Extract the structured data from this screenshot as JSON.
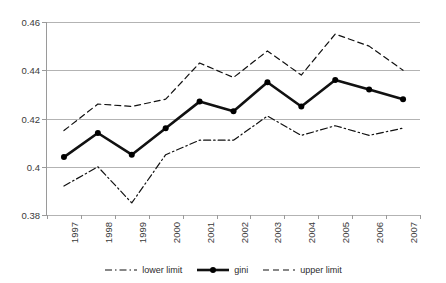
{
  "title_band": {
    "clipped_text": ""
  },
  "legend": {
    "position": "bottom-center",
    "items": [
      {
        "label": "lower limit",
        "style": "dash-dot",
        "color": "#1a1a1a"
      },
      {
        "label": "gini",
        "style": "solid-marker",
        "color": "#000000"
      },
      {
        "label": "upper limit",
        "style": "dashed",
        "color": "#1a1a1a"
      }
    ]
  },
  "axes": {
    "y_ticks": [
      "0.46",
      "0.44",
      "0.42",
      "0.4",
      "0.38"
    ],
    "x_ticks": [
      "1997",
      "1998",
      "1999",
      "2000",
      "2001",
      "2002",
      "2003",
      "2004",
      "2005",
      "2006",
      "2007"
    ]
  },
  "chart_data": {
    "type": "line",
    "title": "",
    "subtitle": "",
    "xlabel": "",
    "ylabel": "",
    "categories": [
      "1997",
      "1998",
      "1999",
      "2000",
      "2001",
      "2002",
      "2003",
      "2004",
      "2005",
      "2006",
      "2007"
    ],
    "x": [
      1997,
      1998,
      1999,
      2000,
      2001,
      2002,
      2003,
      2004,
      2005,
      2006,
      2007
    ],
    "ylim": [
      0.38,
      0.46
    ],
    "ytick_values": [
      0.38,
      0.4,
      0.42,
      0.44,
      0.46
    ],
    "grid": "horizontal",
    "legend_position": "bottom-center",
    "series": [
      {
        "name": "lower limit",
        "style": "dash-dot",
        "markers": false,
        "values": [
          0.392,
          0.4,
          0.385,
          0.405,
          0.411,
          0.411,
          0.421,
          0.413,
          0.417,
          0.413,
          0.416
        ]
      },
      {
        "name": "gini",
        "style": "solid",
        "markers": true,
        "values": [
          0.404,
          0.414,
          0.405,
          0.416,
          0.427,
          0.423,
          0.435,
          0.425,
          0.436,
          0.432,
          0.428
        ]
      },
      {
        "name": "upper limit",
        "style": "dashed",
        "markers": false,
        "values": [
          0.415,
          0.426,
          0.425,
          0.428,
          0.443,
          0.437,
          0.448,
          0.438,
          0.455,
          0.45,
          0.44
        ]
      }
    ]
  }
}
